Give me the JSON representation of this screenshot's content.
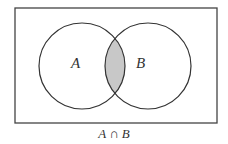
{
  "diagram": {
    "type": "venn",
    "sets": [
      {
        "label": "A"
      },
      {
        "label": "B"
      }
    ],
    "shaded_region": "intersection",
    "caption": "A ∩ B",
    "colors": {
      "stroke": "#333333",
      "shade": "#c8c8c8",
      "background": "#ffffff"
    }
  }
}
